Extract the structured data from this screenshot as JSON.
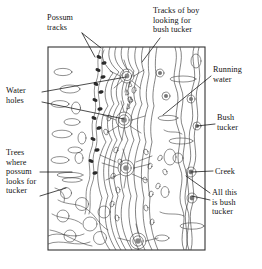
{
  "figure": {
    "type": "annotated-map-diagram",
    "frame": {
      "x": 48,
      "y": 47,
      "width": 157,
      "height": 203
    },
    "ink_color": "#222222",
    "background_color": "#ffffff"
  },
  "annotations": [
    {
      "id": "possum-tracks",
      "text": "Possum\ntracks",
      "position": {
        "x": 47,
        "y": 13
      },
      "side": "top-left",
      "leaders": [
        {
          "from": [
            82,
            33
          ],
          "to": [
            101,
            48
          ]
        },
        {
          "from": [
            82,
            33
          ],
          "to": [
            95,
            57
          ]
        }
      ]
    },
    {
      "id": "tracks-of-boy",
      "text": "Tracks of boy\nlooking for\nbush tucker",
      "position": {
        "x": 153,
        "y": 6
      },
      "side": "top-right",
      "leaders": [
        {
          "from": [
            160,
            38
          ],
          "to": [
            142,
            62
          ]
        }
      ]
    },
    {
      "id": "water-holes",
      "text": "Water\nholes",
      "position": {
        "x": 6,
        "y": 86
      },
      "side": "left",
      "leaders": [
        {
          "from": [
            42,
            92
          ],
          "to": [
            126,
            77
          ]
        },
        {
          "from": [
            42,
            102
          ],
          "to": [
            124,
            119
          ]
        }
      ]
    },
    {
      "id": "running-water",
      "text": "Running\nwater",
      "position": {
        "x": 213,
        "y": 65
      },
      "side": "right",
      "leaders": [
        {
          "from": [
            211,
            76
          ],
          "to": [
            163,
            115
          ]
        }
      ]
    },
    {
      "id": "bush-tucker",
      "text": "Bush\ntucker",
      "position": {
        "x": 217,
        "y": 113
      },
      "side": "right",
      "leaders": [
        {
          "from": [
            215,
            124
          ],
          "to": [
            197,
            126
          ]
        }
      ]
    },
    {
      "id": "trees-where-possum",
      "text": "Trees\nwhere\npossum\nlooks for\ntucker",
      "position": {
        "x": 6,
        "y": 148
      },
      "side": "left",
      "leaders": [
        {
          "from": [
            40,
            172
          ],
          "to": [
            72,
            172
          ]
        },
        {
          "from": [
            40,
            196
          ],
          "to": [
            66,
            188
          ]
        }
      ]
    },
    {
      "id": "creek",
      "text": "Creek",
      "position": {
        "x": 215,
        "y": 167
      },
      "side": "right",
      "leaders": [
        {
          "from": [
            213,
            171
          ],
          "to": [
            191,
            172
          ]
        }
      ]
    },
    {
      "id": "all-this-is-bush-tucker",
      "text": "All this\nis bush\ntucker",
      "position": {
        "x": 212,
        "y": 188
      },
      "side": "right",
      "leaders": [
        {
          "from": [
            210,
            200
          ],
          "to": [
            192,
            196
          ]
        },
        {
          "from": [
            210,
            193
          ],
          "to": [
            186,
            176
          ]
        }
      ]
    }
  ],
  "map_features": {
    "waterholes": [
      {
        "cx": 127,
        "cy": 76,
        "r": 7
      },
      {
        "cx": 124,
        "cy": 120,
        "r": 8
      },
      {
        "cx": 126,
        "cy": 168,
        "r": 8
      },
      {
        "cx": 138,
        "cy": 241,
        "r": 8
      }
    ],
    "possum_track_count": 14,
    "bush_tucker_markers": [
      {
        "cx": 160,
        "cy": 73,
        "r": 4
      },
      {
        "cx": 166,
        "cy": 96,
        "r": 4
      },
      {
        "cx": 191,
        "cy": 99,
        "r": 4
      },
      {
        "cx": 197,
        "cy": 126,
        "r": 4
      },
      {
        "cx": 191,
        "cy": 172,
        "r": 5
      },
      {
        "cx": 192,
        "cy": 198,
        "r": 5
      }
    ],
    "running_water_streams": 9,
    "creek_meanders": 2
  }
}
